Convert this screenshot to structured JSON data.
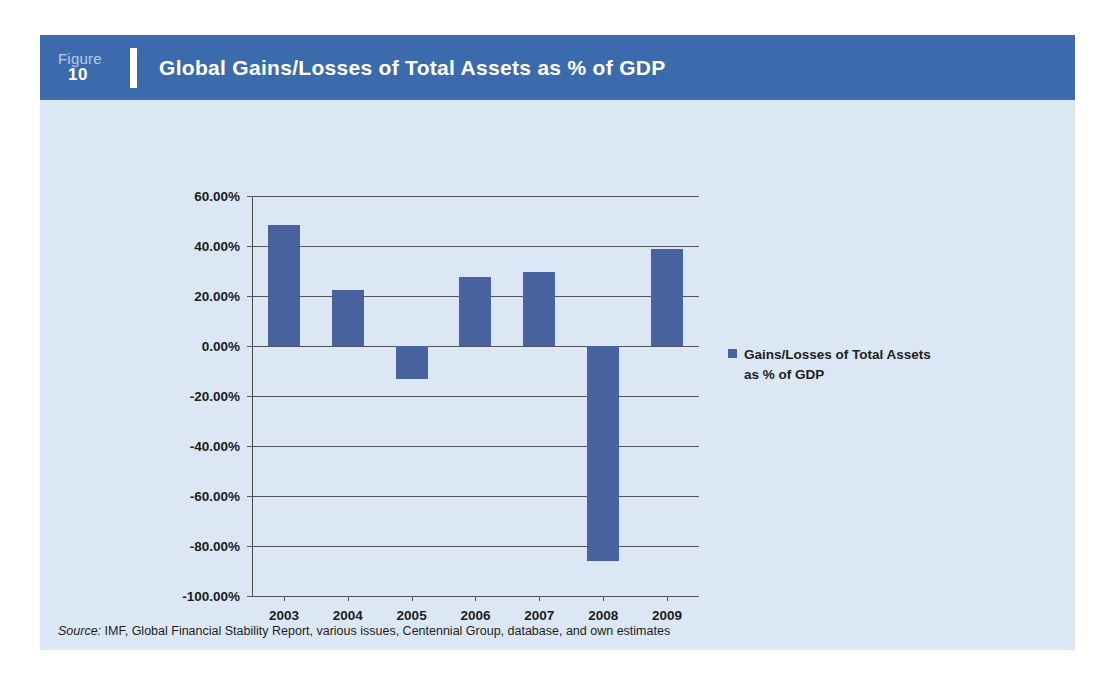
{
  "figure": {
    "label_word": "Figure",
    "number": "10",
    "title": "Global Gains/Losses of Total Assets as % of GDP"
  },
  "source": {
    "prefix": "Source:",
    "text": " IMF, Global Financial Stability Report, various issues, Centennial Group, database, and own estimates"
  },
  "legend": {
    "entries": [
      {
        "label": "Gains/Losses of Total Assets as % of GDP",
        "color": "#48619f"
      }
    ]
  },
  "colors": {
    "header_band": "#3b6bac",
    "panel_background": "#dbe7f4",
    "bar": "#48619f",
    "axis": "#545454",
    "text": "#1d1d1d"
  },
  "chart_data": {
    "type": "bar",
    "title": "Global Gains/Losses of Total Assets as % of GDP",
    "xlabel": "",
    "ylabel": "",
    "categories": [
      "2003",
      "2004",
      "2005",
      "2006",
      "2007",
      "2008",
      "2009"
    ],
    "values": [
      48.5,
      22.5,
      -13.0,
      27.5,
      29.5,
      -86.0,
      39.0
    ],
    "series": [
      {
        "name": "Gains/Losses of Total Assets as % of GDP",
        "values": [
          48.5,
          22.5,
          -13.0,
          27.5,
          29.5,
          -86.0,
          39.0
        ]
      }
    ],
    "ylim": [
      -100,
      60
    ],
    "ytick_values": [
      60,
      40,
      20,
      0,
      -20,
      -40,
      -60,
      -80,
      -100
    ],
    "ytick_labels": [
      "60.00%",
      "40.00%",
      "20.00%",
      "0.00%",
      "-20.00%",
      "-40.00%",
      "-60.00%",
      "-80.00%",
      "-100.00%"
    ],
    "grid": true,
    "legend_position": "right",
    "value_format": "percent"
  }
}
